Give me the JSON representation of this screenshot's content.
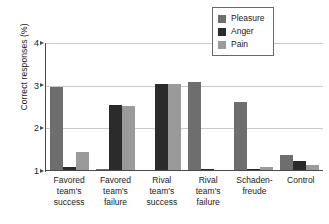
{
  "chart_data": {
    "type": "bar",
    "title": "",
    "subtitle": "",
    "xlabel": "",
    "ylabel": "Correct responses (%)",
    "ylim": [
      1,
      4
    ],
    "yticks": [
      1,
      2,
      3,
      4
    ],
    "ytick_labels": [
      "1",
      "2",
      "3",
      "4"
    ],
    "grid": "horizontal",
    "legend_position": "top-right",
    "categories": [
      "Favored team's success",
      "Favored team's failure",
      "Rival team's success",
      "Rival team's failure",
      "Schadenfreude",
      "Control"
    ],
    "category_lines": [
      [
        "Favored",
        "team's",
        "success"
      ],
      [
        "Favored",
        "team's",
        "failure"
      ],
      [
        "Rival",
        "team's",
        "success"
      ],
      [
        "Rival",
        "team's",
        "failure"
      ],
      [
        "Schaden-",
        "freude"
      ],
      [
        "Control"
      ]
    ],
    "series": [
      {
        "name": "Pleasure",
        "color": "#6e6e6e",
        "values": [
          2.95,
          1.02,
          1.0,
          3.06,
          2.6,
          1.35
        ]
      },
      {
        "name": "Anger",
        "color": "#2b2b2b",
        "values": [
          1.06,
          2.52,
          3.02,
          1.03,
          1.02,
          1.2
        ]
      },
      {
        "name": "Pain",
        "color": "#9a9a9a",
        "values": [
          1.43,
          2.5,
          3.02,
          1.0,
          1.07,
          1.12
        ]
      }
    ]
  },
  "axes": {
    "y_title": "Correct responses (%)"
  },
  "legend": {
    "items": [
      {
        "label": "Pleasure",
        "color": "#6e6e6e"
      },
      {
        "label": "Anger",
        "color": "#2b2b2b"
      },
      {
        "label": "Pain",
        "color": "#9a9a9a"
      }
    ]
  },
  "colors": {
    "pleasure": "#6e6e6e",
    "anger": "#2b2b2b",
    "pain": "#9a9a9a",
    "axis": "#4a4a4a",
    "grid": "#c9c9c9",
    "background": "#ffffff"
  }
}
